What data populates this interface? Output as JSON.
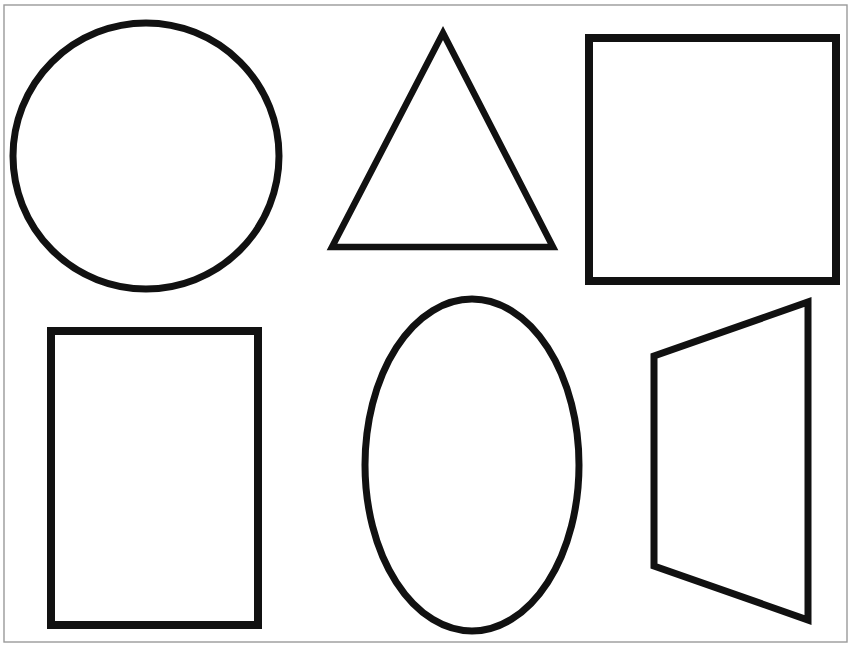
{
  "page": {
    "title": "Basic Shapes Worksheet",
    "background_color": "#ffffff",
    "stroke_color": "#111111",
    "border_color": "#9a9a9a",
    "width": 854,
    "height": 653
  },
  "border": {
    "name": "page-border",
    "x": 4,
    "y": 5,
    "width": 843,
    "height": 637,
    "stroke_width": 1.4
  },
  "shapes": [
    {
      "id": "circle",
      "label": "Circle",
      "row": 1,
      "column": 1,
      "geometry_type": "circle",
      "cx": 146,
      "cy": 156,
      "r": 133,
      "stroke_width": 7
    },
    {
      "id": "triangle",
      "label": "Triangle",
      "row": 1,
      "column": 2,
      "geometry_type": "polygon",
      "points": "443,33 553,247 332,247",
      "stroke_width": 6.5
    },
    {
      "id": "square",
      "label": "Square",
      "row": 1,
      "column": 3,
      "geometry_type": "rect",
      "x": 589,
      "y": 38,
      "width": 247,
      "height": 243,
      "stroke_width": 8
    },
    {
      "id": "rectangle",
      "label": "Rectangle",
      "row": 2,
      "column": 1,
      "geometry_type": "rect",
      "x": 51,
      "y": 331,
      "width": 207,
      "height": 294,
      "stroke_width": 8
    },
    {
      "id": "ellipse",
      "label": "Oval",
      "row": 2,
      "column": 2,
      "geometry_type": "ellipse",
      "cx": 472,
      "cy": 465,
      "rx": 107,
      "ry": 166,
      "stroke_width": 7
    },
    {
      "id": "trapezoid",
      "label": "Trapezoid",
      "row": 2,
      "column": 3,
      "geometry_type": "polygon",
      "points": "808,302 808,620 654,566 654,356",
      "stroke_width": 7
    }
  ]
}
